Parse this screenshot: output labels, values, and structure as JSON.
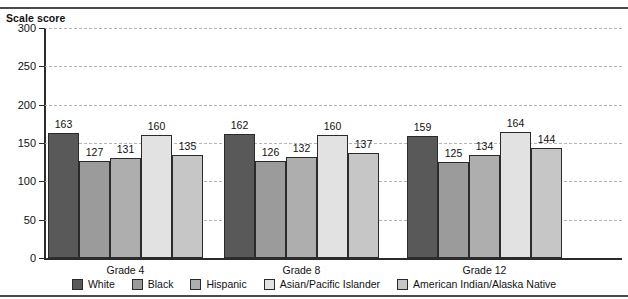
{
  "figure": {
    "cut_off_text_fragment": "",
    "axis_title": "Scale score"
  },
  "chart_data": {
    "type": "bar",
    "title": "Scale score",
    "xlabel": "",
    "ylabel": "Scale score",
    "ylim": [
      0,
      300
    ],
    "yticks": [
      0,
      50,
      100,
      150,
      200,
      250,
      300
    ],
    "grid": true,
    "legend_position": "bottom",
    "categories": [
      "Grade 4",
      "Grade 8",
      "Grade 12"
    ],
    "series": [
      {
        "name": "White",
        "color": "#595959",
        "values": [
          163,
          162,
          159
        ]
      },
      {
        "name": "Black",
        "color": "#9b9b9b",
        "values": [
          127,
          126,
          125
        ]
      },
      {
        "name": "Hispanic",
        "color": "#aeaeae",
        "values": [
          131,
          132,
          134
        ]
      },
      {
        "name": "Asian/Pacific Islander",
        "color": "#e2e2e2",
        "values": [
          160,
          160,
          164
        ]
      },
      {
        "name": "American Indian/Alaska Native",
        "color": "#c6c6c6",
        "values": [
          135,
          137,
          144
        ]
      }
    ]
  },
  "yticks": [
    {
      "label": "300",
      "value": 300
    },
    {
      "label": "250",
      "value": 250
    },
    {
      "label": "200",
      "value": 200
    },
    {
      "label": "150",
      "value": 150
    },
    {
      "label": "100",
      "value": 100
    },
    {
      "label": "50",
      "value": 50
    },
    {
      "label": "0",
      "value": 0
    }
  ],
  "legend": [
    {
      "label": "White",
      "color": "#595959"
    },
    {
      "label": "Black",
      "color": "#9b9b9b"
    },
    {
      "label": "Hispanic",
      "color": "#aeaeae"
    },
    {
      "label": "Asian/Pacific Islander",
      "color": "#e2e2e2"
    },
    {
      "label": "American Indian/Alaska Native",
      "color": "#c6c6c6"
    }
  ]
}
